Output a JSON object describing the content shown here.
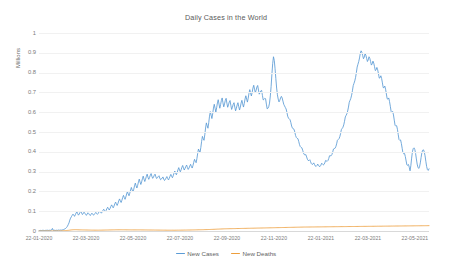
{
  "chart_data": {
    "type": "line",
    "title": "Daily Cases in the World",
    "xlabel": "",
    "ylabel": "Millions",
    "ylim": [
      0,
      1
    ],
    "grid": true,
    "legend_position": "bottom",
    "y_ticks": [
      "0",
      "0.1",
      "0.2",
      "0.3",
      "0.4",
      "0.5",
      "0.6",
      "0.7",
      "0.8",
      "0.9",
      "1"
    ],
    "y_tick_values": [
      0,
      0.1,
      0.2,
      0.3,
      0.4,
      0.5,
      0.6,
      0.7,
      0.8,
      0.9,
      1
    ],
    "x_tick_labels": [
      "22-01-2020",
      "22-03-2020",
      "22-05-2020",
      "22-07-2020",
      "22-09-2020",
      "22-11-2020",
      "22-01-2021",
      "22-03-2021",
      "22-05-2021"
    ],
    "x_tick_positions": [
      0,
      0.1205,
      0.241,
      0.3614,
      0.4819,
      0.6024,
      0.7229,
      0.8434,
      0.9638
    ],
    "x_axis_start": "22-01-2020",
    "x_axis_end": "22-06-2021",
    "series": [
      {
        "name": "New Cases",
        "color": "#5b9bd5",
        "values": [
          0.001,
          0.002,
          0.003,
          0.002,
          0.003,
          0.004,
          0.003,
          0.002,
          0.003,
          0.004,
          0.003,
          0.004,
          0.003,
          0.004,
          0.003,
          0.004,
          0.005,
          0.013,
          0.004,
          0.003,
          0.004,
          0.003,
          0.004,
          0.003,
          0.004,
          0.005,
          0.004,
          0.005,
          0.004,
          0.005,
          0.006,
          0.007,
          0.009,
          0.011,
          0.014,
          0.018,
          0.024,
          0.032,
          0.041,
          0.055,
          0.065,
          0.072,
          0.079,
          0.085,
          0.081,
          0.074,
          0.082,
          0.091,
          0.097,
          0.088,
          0.08,
          0.086,
          0.094,
          0.099,
          0.091,
          0.083,
          0.088,
          0.095,
          0.09,
          0.084,
          0.079,
          0.086,
          0.092,
          0.088,
          0.082,
          0.078,
          0.085,
          0.09,
          0.086,
          0.08,
          0.083,
          0.089,
          0.094,
          0.088,
          0.084,
          0.089,
          0.096,
          0.101,
          0.095,
          0.09,
          0.096,
          0.104,
          0.11,
          0.103,
          0.097,
          0.104,
          0.113,
          0.12,
          0.112,
          0.106,
          0.114,
          0.124,
          0.132,
          0.124,
          0.117,
          0.126,
          0.137,
          0.146,
          0.137,
          0.129,
          0.139,
          0.152,
          0.162,
          0.152,
          0.144,
          0.155,
          0.169,
          0.18,
          0.169,
          0.16,
          0.172,
          0.187,
          0.199,
          0.187,
          0.178,
          0.191,
          0.207,
          0.22,
          0.207,
          0.197,
          0.211,
          0.228,
          0.242,
          0.228,
          0.217,
          0.231,
          0.248,
          0.262,
          0.247,
          0.235,
          0.248,
          0.264,
          0.277,
          0.262,
          0.25,
          0.262,
          0.276,
          0.287,
          0.272,
          0.261,
          0.27,
          0.282,
          0.29,
          0.276,
          0.266,
          0.272,
          0.281,
          0.287,
          0.274,
          0.265,
          0.269,
          0.275,
          0.279,
          0.267,
          0.259,
          0.262,
          0.268,
          0.273,
          0.262,
          0.255,
          0.26,
          0.268,
          0.275,
          0.265,
          0.258,
          0.266,
          0.277,
          0.286,
          0.276,
          0.269,
          0.279,
          0.292,
          0.303,
          0.292,
          0.284,
          0.295,
          0.309,
          0.32,
          0.308,
          0.299,
          0.309,
          0.322,
          0.331,
          0.318,
          0.308,
          0.316,
          0.326,
          0.333,
          0.32,
          0.311,
          0.318,
          0.328,
          0.337,
          0.326,
          0.318,
          0.33,
          0.347,
          0.362,
          0.352,
          0.345,
          0.365,
          0.392,
          0.414,
          0.404,
          0.397,
          0.422,
          0.453,
          0.478,
          0.467,
          0.458,
          0.486,
          0.52,
          0.546,
          0.532,
          0.519,
          0.547,
          0.58,
          0.603,
          0.585,
          0.568,
          0.592,
          0.621,
          0.64,
          0.62,
          0.601,
          0.622,
          0.647,
          0.663,
          0.641,
          0.62,
          0.638,
          0.659,
          0.672,
          0.648,
          0.627,
          0.642,
          0.66,
          0.67,
          0.646,
          0.625,
          0.637,
          0.652,
          0.659,
          0.635,
          0.614,
          0.625,
          0.64,
          0.648,
          0.626,
          0.607,
          0.62,
          0.637,
          0.648,
          0.628,
          0.611,
          0.626,
          0.646,
          0.66,
          0.642,
          0.626,
          0.644,
          0.667,
          0.683,
          0.666,
          0.651,
          0.671,
          0.696,
          0.714,
          0.697,
          0.682,
          0.7,
          0.722,
          0.736,
          0.716,
          0.698,
          0.711,
          0.727,
          0.735,
          0.712,
          0.691,
          0.698,
          0.708,
          0.71,
          0.685,
          0.662,
          0.665,
          0.67,
          0.668,
          0.641,
          0.617,
          0.62,
          0.628,
          0.646,
          0.682,
          0.73,
          0.79,
          0.845,
          0.88,
          0.862,
          0.82,
          0.77,
          0.722,
          0.688,
          0.666,
          0.652,
          0.66,
          0.672,
          0.68,
          0.672,
          0.656,
          0.64,
          0.632,
          0.624,
          0.616,
          0.6,
          0.58,
          0.57,
          0.566,
          0.562,
          0.548,
          0.53,
          0.52,
          0.516,
          0.514,
          0.5,
          0.482,
          0.472,
          0.468,
          0.466,
          0.452,
          0.436,
          0.426,
          0.422,
          0.42,
          0.408,
          0.394,
          0.386,
          0.384,
          0.386,
          0.374,
          0.362,
          0.356,
          0.356,
          0.36,
          0.35,
          0.34,
          0.336,
          0.338,
          0.344,
          0.336,
          0.328,
          0.326,
          0.33,
          0.338,
          0.332,
          0.326,
          0.326,
          0.332,
          0.342,
          0.338,
          0.334,
          0.336,
          0.344,
          0.356,
          0.354,
          0.352,
          0.356,
          0.366,
          0.38,
          0.38,
          0.38,
          0.386,
          0.398,
          0.414,
          0.416,
          0.418,
          0.426,
          0.44,
          0.458,
          0.462,
          0.466,
          0.476,
          0.492,
          0.512,
          0.518,
          0.524,
          0.536,
          0.554,
          0.576,
          0.584,
          0.592,
          0.606,
          0.626,
          0.65,
          0.66,
          0.67,
          0.686,
          0.708,
          0.734,
          0.746,
          0.758,
          0.776,
          0.8,
          0.828,
          0.842,
          0.856,
          0.874,
          0.898,
          0.91,
          0.902,
          0.886,
          0.87,
          0.878,
          0.896,
          0.888,
          0.872,
          0.856,
          0.864,
          0.88,
          0.872,
          0.856,
          0.838,
          0.844,
          0.858,
          0.848,
          0.83,
          0.81,
          0.814,
          0.826,
          0.814,
          0.794,
          0.772,
          0.774,
          0.784,
          0.77,
          0.748,
          0.724,
          0.724,
          0.732,
          0.716,
          0.692,
          0.668,
          0.666,
          0.672,
          0.654,
          0.63,
          0.604,
          0.6,
          0.604,
          0.586,
          0.56,
          0.534,
          0.53,
          0.532,
          0.514,
          0.488,
          0.462,
          0.458,
          0.46,
          0.442,
          0.418,
          0.394,
          0.39,
          0.392,
          0.376,
          0.354,
          0.334,
          0.332,
          0.336,
          0.322,
          0.304,
          0.33,
          0.368,
          0.4,
          0.416,
          0.42,
          0.412,
          0.392,
          0.364,
          0.338,
          0.322,
          0.316,
          0.324,
          0.344,
          0.372,
          0.396,
          0.408,
          0.41,
          0.4,
          0.38,
          0.352,
          0.326,
          0.31,
          0.306,
          0.314
        ]
      },
      {
        "name": "New Deaths",
        "color": "#ed9e3c",
        "values": [
          0.0,
          0.0,
          0.0,
          0.0,
          0.0,
          0.0,
          0.0,
          0.0,
          0.0,
          0.0,
          0.0001,
          0.0001,
          0.0001,
          0.0001,
          0.0001,
          0.0001,
          0.0002,
          0.0002,
          0.0002,
          0.0002,
          0.0003,
          0.0003,
          0.0003,
          0.0004,
          0.0005,
          0.0006,
          0.0008,
          0.001,
          0.0013,
          0.0016,
          0.002,
          0.0024,
          0.0029,
          0.0034,
          0.004,
          0.0046,
          0.0052,
          0.0057,
          0.0061,
          0.0064,
          0.0066,
          0.0066,
          0.0065,
          0.0063,
          0.0061,
          0.0059,
          0.0058,
          0.0057,
          0.0056,
          0.0055,
          0.0054,
          0.0053,
          0.0052,
          0.0051,
          0.005,
          0.0049,
          0.0048,
          0.0047,
          0.0046,
          0.0045,
          0.0044,
          0.0044,
          0.0043,
          0.0043,
          0.0042,
          0.0042,
          0.0042,
          0.0042,
          0.0043,
          0.0043,
          0.0044,
          0.0045,
          0.0046,
          0.0047,
          0.0048,
          0.0049,
          0.005,
          0.0051,
          0.0052,
          0.0053,
          0.0054,
          0.0055,
          0.0056,
          0.0057,
          0.0058,
          0.0059,
          0.006,
          0.006,
          0.0061,
          0.0061,
          0.0062,
          0.0062,
          0.0062,
          0.0062,
          0.0061,
          0.0061,
          0.006,
          0.006,
          0.0059,
          0.0059,
          0.0058,
          0.0058,
          0.0057,
          0.0057,
          0.0056,
          0.0056,
          0.0056,
          0.0056,
          0.0056,
          0.0056,
          0.0056,
          0.0056,
          0.0056,
          0.0056,
          0.0056,
          0.0055,
          0.0055,
          0.0055,
          0.0054,
          0.0054,
          0.0053,
          0.0053,
          0.0052,
          0.0052,
          0.0051,
          0.0051,
          0.005,
          0.005,
          0.0049,
          0.0049,
          0.0048,
          0.0048,
          0.0047,
          0.0047,
          0.0046,
          0.0046,
          0.0045,
          0.0045,
          0.0044,
          0.0044,
          0.0043,
          0.0043,
          0.0042,
          0.0042,
          0.0041,
          0.0041,
          0.004,
          0.004,
          0.004,
          0.004,
          0.004,
          0.004,
          0.004,
          0.004,
          0.0041,
          0.0041,
          0.0042,
          0.0042,
          0.0043,
          0.0043,
          0.0044,
          0.0045,
          0.0045,
          0.0046,
          0.0047,
          0.0047,
          0.0048,
          0.0049,
          0.005,
          0.005,
          0.0051,
          0.0052,
          0.0053,
          0.0054,
          0.0055,
          0.0056,
          0.0057,
          0.0058,
          0.0059,
          0.006,
          0.0061,
          0.0062,
          0.0063,
          0.0064,
          0.0065,
          0.0066,
          0.0068,
          0.0069,
          0.007,
          0.0072,
          0.0073,
          0.0075,
          0.0076,
          0.0078,
          0.008,
          0.0082,
          0.0084,
          0.0086,
          0.0088,
          0.009,
          0.0092,
          0.0094,
          0.0096,
          0.0098,
          0.01,
          0.0102,
          0.0104,
          0.0106,
          0.0108,
          0.011,
          0.0111,
          0.0112,
          0.0113,
          0.0114,
          0.0115,
          0.0116,
          0.0117,
          0.0118,
          0.0119,
          0.012,
          0.0121,
          0.0122,
          0.0123,
          0.0124,
          0.0125,
          0.0126,
          0.0127,
          0.0128,
          0.0129,
          0.013,
          0.0131,
          0.0132,
          0.0133,
          0.0134,
          0.0135,
          0.0136,
          0.0137,
          0.0138,
          0.0139,
          0.014,
          0.0141,
          0.0142,
          0.0143,
          0.0144,
          0.0145,
          0.0146,
          0.0147,
          0.0148,
          0.0149,
          0.015,
          0.0151,
          0.0152,
          0.0153,
          0.0154,
          0.0155,
          0.0156,
          0.0157,
          0.0158,
          0.0159,
          0.016,
          0.0161,
          0.0162,
          0.0163,
          0.0164,
          0.0165,
          0.0166,
          0.0167,
          0.0168,
          0.0169,
          0.017,
          0.0171,
          0.0172,
          0.0173,
          0.0174,
          0.0175,
          0.0176,
          0.0177,
          0.0178,
          0.0179,
          0.018,
          0.0181,
          0.0182,
          0.0183,
          0.0184,
          0.0185,
          0.0186,
          0.0187,
          0.0188,
          0.0189,
          0.019,
          0.0191,
          0.0192,
          0.0193,
          0.0194,
          0.0195,
          0.0196,
          0.0197,
          0.0198,
          0.0199,
          0.02,
          0.02,
          0.0201,
          0.0201,
          0.0202,
          0.0202,
          0.0203,
          0.0203,
          0.0204,
          0.0204,
          0.0205,
          0.0205,
          0.0206,
          0.0206,
          0.0207,
          0.0207,
          0.0208,
          0.0208,
          0.0209,
          0.0209,
          0.021,
          0.021,
          0.0211,
          0.0211,
          0.0212,
          0.0212,
          0.0213,
          0.0213,
          0.0214,
          0.0214,
          0.0215,
          0.0215,
          0.0216,
          0.0216,
          0.0217,
          0.0217,
          0.0218,
          0.0218,
          0.0219,
          0.0219,
          0.022,
          0.022,
          0.0221,
          0.0221,
          0.0222,
          0.0222,
          0.0223,
          0.0223,
          0.0224,
          0.0224,
          0.0225,
          0.0225,
          0.0226,
          0.0226,
          0.0227,
          0.0227,
          0.0228,
          0.0228,
          0.0229,
          0.0229,
          0.023,
          0.023,
          0.0231,
          0.0231,
          0.0232,
          0.0232,
          0.0233,
          0.0233,
          0.0234,
          0.0234,
          0.0235,
          0.0235,
          0.0236,
          0.0236,
          0.0237,
          0.0237,
          0.0238,
          0.0238,
          0.0239,
          0.0239,
          0.024,
          0.024,
          0.0241,
          0.0241,
          0.0242,
          0.0242,
          0.0243,
          0.0243,
          0.0244,
          0.0244,
          0.0245,
          0.0245,
          0.0246,
          0.0246,
          0.0247,
          0.0247,
          0.0248,
          0.0248,
          0.0249,
          0.0249,
          0.025,
          0.025,
          0.0251,
          0.0251,
          0.0252,
          0.0252,
          0.0253,
          0.0253,
          0.0254,
          0.0254,
          0.0255,
          0.0255,
          0.0256,
          0.0256,
          0.0257,
          0.0257,
          0.0258,
          0.0258,
          0.0259,
          0.0259,
          0.026,
          0.026,
          0.0261,
          0.0261,
          0.0262,
          0.0262,
          0.0263,
          0.0263,
          0.0264,
          0.0264,
          0.0265,
          0.0265,
          0.0266,
          0.0266,
          0.0267,
          0.0267,
          0.0268,
          0.0268,
          0.0269,
          0.0269,
          0.027
        ]
      }
    ]
  },
  "legend": {
    "entries": [
      {
        "label": "New Cases",
        "color": "#5b9bd5"
      },
      {
        "label": "New Deaths",
        "color": "#ed9e3c"
      }
    ]
  }
}
